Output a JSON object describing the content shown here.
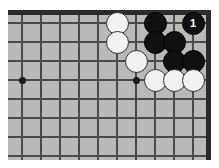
{
  "diagram": {
    "board_color": "#b9b9b9",
    "line_color": "#4a4a4a",
    "edge_color": "#2b2b2b",
    "black_color": "#101010",
    "white_color": "#f2f2f2",
    "page_background": "#ffffff",
    "grid": {
      "spacing_px": 19,
      "columns": 10,
      "rows": 8,
      "origin_x": 14,
      "origin_y": 13,
      "edges_shown": [
        "top",
        "right"
      ]
    },
    "star_points": [
      {
        "name": "hoshi-left",
        "col": 1,
        "row": 4
      },
      {
        "name": "hoshi-right",
        "col": 7,
        "row": 4
      }
    ],
    "stones": [
      {
        "name": "white-stone-c6r1",
        "color": "white",
        "col": 6,
        "row": 1,
        "label": ""
      },
      {
        "name": "black-stone-c8r1",
        "color": "black",
        "col": 8,
        "row": 1,
        "label": ""
      },
      {
        "name": "black-stone-move-1",
        "color": "black",
        "col": 10,
        "row": 1,
        "label": "1"
      },
      {
        "name": "white-stone-c6r2",
        "color": "white",
        "col": 6,
        "row": 2,
        "label": ""
      },
      {
        "name": "black-stone-c8r2",
        "color": "black",
        "col": 8,
        "row": 2,
        "label": ""
      },
      {
        "name": "black-stone-c9r2",
        "color": "black",
        "col": 9,
        "row": 2,
        "label": ""
      },
      {
        "name": "white-stone-c7r3",
        "color": "white",
        "col": 7,
        "row": 3,
        "label": ""
      },
      {
        "name": "black-stone-c9r3",
        "color": "black",
        "col": 9,
        "row": 3,
        "label": ""
      },
      {
        "name": "black-stone-c10r3",
        "color": "black",
        "col": 10,
        "row": 3,
        "label": ""
      },
      {
        "name": "white-stone-c8r4",
        "color": "white",
        "col": 8,
        "row": 4,
        "label": ""
      },
      {
        "name": "white-stone-c9r4",
        "color": "white",
        "col": 9,
        "row": 4,
        "label": ""
      },
      {
        "name": "white-stone-c10r4",
        "color": "white",
        "col": 10,
        "row": 4,
        "label": ""
      }
    ],
    "move_numbers": [
      {
        "number": "1",
        "color": "black",
        "col": 10,
        "row": 1
      }
    ]
  }
}
